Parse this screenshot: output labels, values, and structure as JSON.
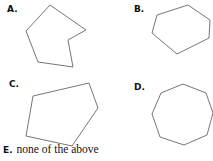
{
  "question": {
    "choices": [
      {
        "letter": "A.",
        "shape": "concave hexagon (irregular)",
        "label_pos": [
          7,
          5
        ],
        "points": "50,5 86,30 68,40 73,67 38,62 26,31"
      },
      {
        "letter": "B.",
        "shape": "irregular hexagon",
        "label_pos": [
          134,
          5
        ],
        "points": "188,5 210,20 209,38 177,54 152,33 157,15"
      },
      {
        "letter": "C.",
        "shape": "irregular pentagon",
        "label_pos": [
          9,
          80
        ],
        "points": "33,96 89,83 98,108 72,146 26,136"
      },
      {
        "letter": "D.",
        "shape": "regular octagon",
        "label_pos": [
          134,
          83
        ],
        "points": "183,84 206,93 213,113 207,135 184,145 160,137 152,114 161,93"
      }
    ],
    "choice_e": {
      "letter": "E.",
      "text": "none of the above"
    }
  },
  "colors": {
    "stroke": "#666666",
    "text": "#111111",
    "background": "#ffffff"
  }
}
